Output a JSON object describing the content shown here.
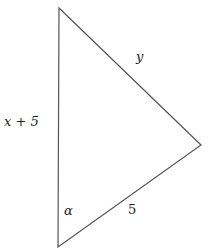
{
  "diagram": {
    "type": "triangle",
    "vertices": {
      "top": [
        59,
        8
      ],
      "right": [
        201,
        145
      ],
      "bottom": [
        58,
        247
      ]
    },
    "stroke_color": "#555555",
    "labels": {
      "left_side": "x + 5",
      "hypotenuse_top": "y",
      "bottom_side": "5",
      "angle_bottom": "α"
    }
  }
}
